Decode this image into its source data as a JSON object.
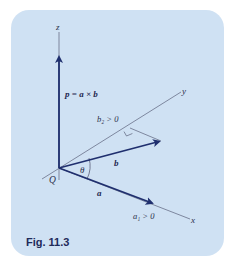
{
  "figure": {
    "caption": "Fig. 11.3",
    "colors": {
      "panel_background": "#cfe1f3",
      "vector": "#1f2f6e",
      "axis": "#5a607a",
      "text": "#2a2f4a"
    },
    "axes": {
      "x_label": "x",
      "y_label": "y",
      "z_label": "z"
    },
    "origin_label": "Q",
    "vectors": {
      "p_label": "p = a × b",
      "a_label": "a",
      "b_label": "b"
    },
    "angle_label": "θ",
    "annotations": {
      "b2": "b₂ > 0",
      "a1": "a₁ > 0"
    }
  }
}
